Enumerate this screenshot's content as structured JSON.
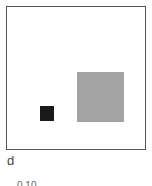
{
  "panel": {
    "label": "d",
    "sublabel": "0.10",
    "frame_border_color": "#555555",
    "background_color": "#ffffff"
  },
  "shapes": [
    {
      "name": "small-dark-square",
      "color": "#1a1a1a"
    },
    {
      "name": "large-grey-square",
      "color": "#a3a3a3"
    }
  ]
}
